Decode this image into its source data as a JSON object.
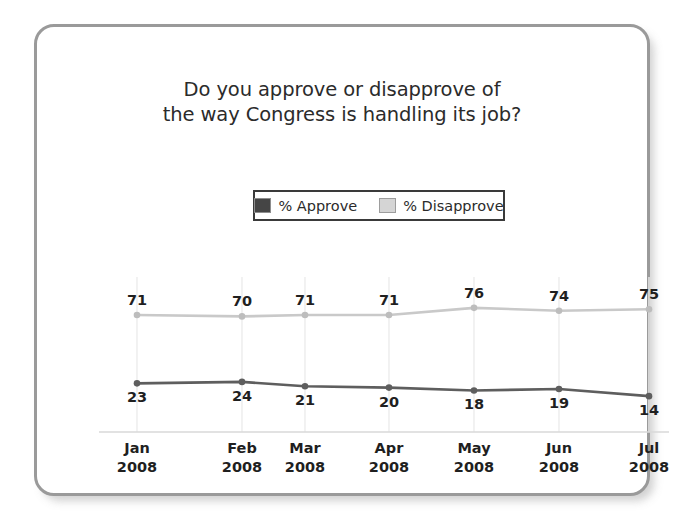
{
  "chart_data": {
    "type": "line",
    "title": "Do you approve or disapprove of the way Congress is handling its job?",
    "title_line1": "Do you approve or disapprove of",
    "title_line2": "the way Congress is handling its job?",
    "xlabel": "",
    "ylabel": "",
    "ylim": [
      0,
      100
    ],
    "grid": "vertical",
    "legend_position": "top-center",
    "categories": [
      "Jan 2008",
      "Feb 2008",
      "Mar 2008",
      "Apr 2008",
      "May 2008",
      "Jun 2008",
      "Jul 2008"
    ],
    "category_months": [
      "Jan",
      "Feb",
      "Mar",
      "Apr",
      "May",
      "Jun",
      "Jul"
    ],
    "category_years": [
      "2008",
      "2008",
      "2008",
      "2008",
      "2008",
      "2008",
      "2008"
    ],
    "series": [
      {
        "name": "% Approve",
        "color": "#5e5e5e",
        "values": [
          23,
          24,
          21,
          20,
          18,
          19,
          14
        ]
      },
      {
        "name": "% Disapprove",
        "color": "#c9c9c9",
        "values": [
          71,
          70,
          71,
          71,
          76,
          74,
          75
        ]
      }
    ]
  },
  "legend": {
    "items": [
      {
        "label": "% Approve",
        "color": "#454545"
      },
      {
        "label": "% Disapprove",
        "color": "#d5d5d5"
      }
    ]
  },
  "colors": {
    "approve_line": "#5e5e5e",
    "disapprove_line": "#c9c9c9",
    "gridline": "#ececec",
    "axis": "#d9d9d9",
    "frame_border": "#9a9a9a",
    "text": "#1f1f1f",
    "background": "#ffffff"
  }
}
